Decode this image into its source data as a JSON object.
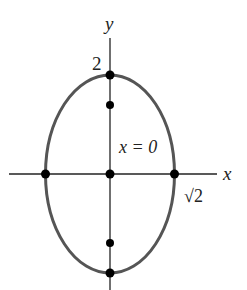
{
  "diagram": {
    "type": "ellipse-plot",
    "equation_hint": "x^2/2 + y^2/4 = 1",
    "axes": {
      "x_label": "x",
      "y_label": "y"
    },
    "labels": {
      "y_intercept": "2",
      "x_intercept": "√2",
      "line_label": "x = 0"
    },
    "points": [
      {
        "name": "top-vertex",
        "x": 0,
        "y": 2
      },
      {
        "name": "upper-focus",
        "x": 0,
        "y": 1.414
      },
      {
        "name": "center",
        "x": 0,
        "y": 0
      },
      {
        "name": "left-vertex",
        "x": -1.414,
        "y": 0
      },
      {
        "name": "right-vertex",
        "x": 1.414,
        "y": 0
      },
      {
        "name": "lower-focus",
        "x": 0,
        "y": -1.414
      },
      {
        "name": "bottom-vertex",
        "x": 0,
        "y": -2
      }
    ],
    "colors": {
      "curve": "#555555",
      "axes": "#222222",
      "points": "#000000"
    }
  }
}
